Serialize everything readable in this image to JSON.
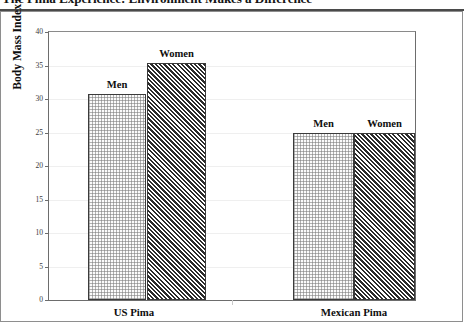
{
  "title": "The Pima Experience: Environment Makes a Difference",
  "chart_data": {
    "type": "bar",
    "title": "The Pima Experience: Environment Makes a Difference",
    "xlabel": "",
    "ylabel": "Body Mass Index (BMI)",
    "ylim": [
      0,
      40
    ],
    "ytick_labels": [
      "0",
      "5",
      "10",
      "15",
      "20",
      "25",
      "30",
      "35",
      "40"
    ],
    "ytick_values": [
      0,
      5,
      10,
      15,
      20,
      25,
      30,
      35,
      40
    ],
    "grid": true,
    "legend": "none",
    "categories": [
      "US Pima",
      "Mexican Pima"
    ],
    "series": [
      {
        "name": "Men",
        "values": [
          30.7,
          25.0
        ],
        "fill": "light-stipple",
        "color": "#fbfbfb"
      },
      {
        "name": "Women",
        "values": [
          35.4,
          25.0
        ],
        "fill": "dark-diagonal-hatch",
        "color": "#2b2b2b"
      }
    ],
    "bar_labels": [
      {
        "text": "Men",
        "group": "US Pima",
        "value": 30.7
      },
      {
        "text": "Women",
        "group": "US Pima",
        "value": 35.4
      },
      {
        "text": "Men",
        "group": "Mexican Pima",
        "value": 25.0
      },
      {
        "text": "Women",
        "group": "Mexican Pima",
        "value": 25.0
      }
    ]
  },
  "colors": {
    "axis": "#6d6d6d",
    "grid": "#efefef",
    "border": "#8e8e8e",
    "title_rule": "#4a4a4a",
    "text": "#0f0f0f"
  }
}
